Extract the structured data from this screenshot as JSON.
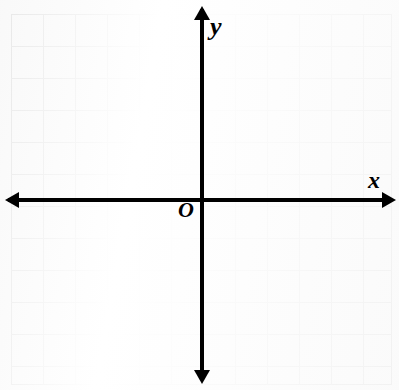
{
  "figure": {
    "type": "coordinate-plane",
    "background_color": "#ffffff",
    "axis_color": "#000000",
    "grid_color": "#5c5c5c"
  },
  "labels": {
    "y_axis": "y",
    "x_axis": "x",
    "origin": "O"
  },
  "grid": {
    "columns": 12,
    "rows": 11,
    "cell_size_px": 32,
    "left_px": 11,
    "top_px": 14,
    "width_px": 381,
    "height_px": 371,
    "origin_x_px": 202,
    "origin_y_px": 200,
    "units_left_of_origin": 6,
    "units_right_of_origin": 6,
    "units_above_origin": 6,
    "units_below_origin": 6
  },
  "chart_data": {
    "type": "scatter",
    "title": "",
    "xlabel": "x",
    "ylabel": "y",
    "xlim": [
      -6,
      6
    ],
    "ylim": [
      -6,
      6
    ],
    "grid": true,
    "legend": null,
    "x": [],
    "y": [],
    "annotations": [
      "O"
    ]
  }
}
